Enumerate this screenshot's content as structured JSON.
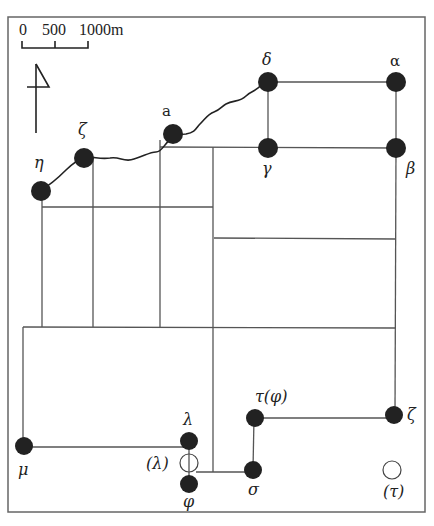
{
  "scale_bar": {
    "labels": [
      "0",
      "500",
      "1000m"
    ],
    "unit": "m",
    "ticks": [
      0,
      500,
      1000
    ]
  },
  "north_arrow": {
    "icon": "north-arrow-icon"
  },
  "nodes": [
    {
      "id": "alpha",
      "label": "α",
      "x": 396,
      "y": 82,
      "type": "filled"
    },
    {
      "id": "beta",
      "label": "β",
      "x": 396,
      "y": 148,
      "type": "filled"
    },
    {
      "id": "gamma",
      "label": "γ",
      "x": 268,
      "y": 148,
      "type": "filled"
    },
    {
      "id": "delta",
      "label": "δ",
      "x": 268,
      "y": 82,
      "type": "filled"
    },
    {
      "id": "a",
      "label": "a",
      "x": 173,
      "y": 134,
      "type": "filled"
    },
    {
      "id": "zeta_top",
      "label": "ζ",
      "x": 84,
      "y": 158,
      "type": "filled"
    },
    {
      "id": "eta",
      "label": "η",
      "x": 41,
      "y": 190,
      "type": "filled"
    },
    {
      "id": "mu",
      "label": "μ",
      "x": 24,
      "y": 446,
      "type": "filled"
    },
    {
      "id": "lambda",
      "label": "λ",
      "x": 189,
      "y": 441,
      "type": "filled"
    },
    {
      "id": "lambda_alt",
      "label": "(λ)",
      "x": 189,
      "y": 463,
      "type": "hollow"
    },
    {
      "id": "phi",
      "label": "φ",
      "x": 189,
      "y": 483,
      "type": "filled"
    },
    {
      "id": "sigma",
      "label": "σ",
      "x": 253,
      "y": 469,
      "type": "filled"
    },
    {
      "id": "tau",
      "label": "τ(φ)",
      "x": 254,
      "y": 418,
      "type": "filled"
    },
    {
      "id": "zeta_right",
      "label": "ζ",
      "x": 394,
      "y": 415,
      "type": "filled"
    },
    {
      "id": "tau_alt",
      "label": "(τ)",
      "x": 392,
      "y": 470,
      "type": "hollow"
    }
  ],
  "colors": {
    "node": "#222222",
    "line": "#555555",
    "background": "#ffffff"
  }
}
